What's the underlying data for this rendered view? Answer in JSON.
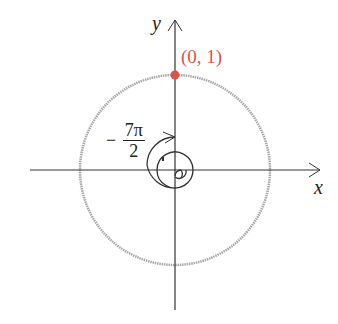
{
  "diagram": {
    "axes": {
      "x_label": "x",
      "y_label": "y"
    },
    "point": {
      "label": "(0, 1)",
      "color": "#d9544a"
    },
    "angle": {
      "sign": "−",
      "numerator": "7π",
      "denominator": "2"
    },
    "circle_color": "#a8a8a8",
    "axis_color": "#333333"
  }
}
